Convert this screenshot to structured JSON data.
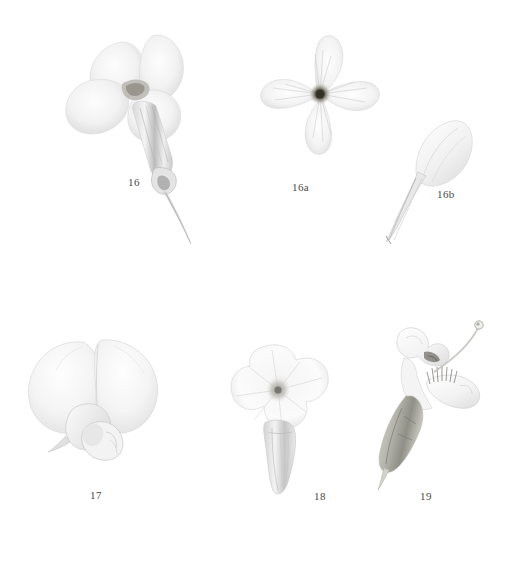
{
  "plate": {
    "background_color": "#ffffff",
    "medium": "pale pencil and watercolour botanical study",
    "caption_color": "#4a4a4a",
    "ink_pale": "#efefef",
    "ink_mid": "#cfcfcf",
    "ink_dark": "#8f8f8f",
    "ink_accent": "#5b5b55"
  },
  "figures": [
    {
      "id": "figure-16",
      "label": "16",
      "description": "four-petalled flower in side view with long narrow tube and spur",
      "label_x": 128,
      "label_y": 176
    },
    {
      "id": "figure-16a",
      "label": "16a",
      "description": "four-petalled cruciform flower viewed face-on with dark centre",
      "label_x": 292,
      "label_y": 181
    },
    {
      "id": "figure-16b",
      "label": "16b",
      "description": "single detached spatulate petal with long claw",
      "label_x": 437,
      "label_y": 188
    },
    {
      "id": "figure-17",
      "label": "17",
      "description": "papilionaceous pea-like flower with broad standard, wings and keel",
      "label_x": 90,
      "label_y": 489
    },
    {
      "id": "figure-18",
      "label": "18",
      "description": "funnel-form salverform flower with flaring limb and long tube",
      "label_x": 314,
      "label_y": 490
    },
    {
      "id": "figure-19",
      "label": "19",
      "description": "bilabiate flower in side view with exserted curved style and fringed lip",
      "label_x": 420,
      "label_y": 490
    }
  ]
}
